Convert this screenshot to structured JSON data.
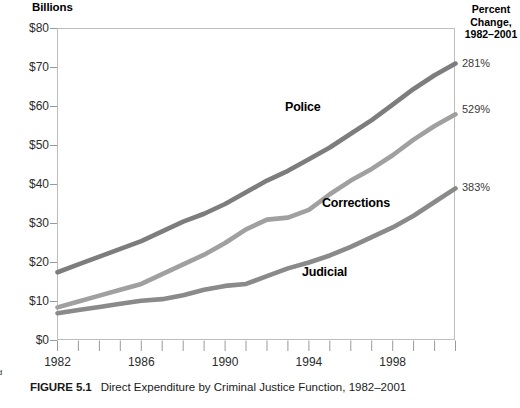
{
  "figure": {
    "number": "FIGURE 5.1",
    "caption": "Direct Expenditure by Criminal Justice Function, 1982–2001",
    "margin_scrap_top": "▪",
    "margin_scrap_bottom": "ed"
  },
  "chart_data": {
    "type": "line",
    "title": "Direct Expenditure by Criminal Justice Function, 1982–2001",
    "subtitle": "",
    "axis_header": "Billions",
    "xlabel": "",
    "ylabel": "Billions",
    "xlim": [
      1982,
      2001
    ],
    "ylim": [
      0,
      80
    ],
    "grid": false,
    "legend_position": "inline-annotations",
    "y_ticks": [
      0,
      10,
      20,
      30,
      40,
      50,
      60,
      70,
      80
    ],
    "y_tick_labels": [
      "$0",
      "$10",
      "$20",
      "$30",
      "$40",
      "$50",
      "$60",
      "$70",
      "$80"
    ],
    "x_ticks": [
      1982,
      1983,
      1984,
      1985,
      1986,
      1987,
      1988,
      1989,
      1990,
      1991,
      1992,
      1993,
      1994,
      1995,
      1996,
      1997,
      1998,
      1999,
      2000,
      2001
    ],
    "x_tick_labels_shown": [
      "1982",
      "1986",
      "1990",
      "1994",
      "1998"
    ],
    "x_labeled_ticks": [
      1982,
      1986,
      1990,
      1994,
      1998
    ],
    "x": [
      1982,
      1983,
      1984,
      1985,
      1986,
      1987,
      1988,
      1989,
      1990,
      1991,
      1992,
      1993,
      1994,
      1995,
      1996,
      1997,
      1998,
      1999,
      2000,
      2001
    ],
    "series": [
      {
        "name": "Police",
        "label": "Police",
        "color": "#7d7d7d",
        "percent_change": "281%",
        "values": [
          17.5,
          19.5,
          21.5,
          23.5,
          25.5,
          28.0,
          30.5,
          32.5,
          35.0,
          38.0,
          41.0,
          43.5,
          46.5,
          49.5,
          53.0,
          56.5,
          60.5,
          64.5,
          68.0,
          71.0
        ]
      },
      {
        "name": "Corrections",
        "label": "Corrections",
        "color": "#a0a0a0",
        "percent_change": "529%",
        "values": [
          8.5,
          10.0,
          11.5,
          13.0,
          14.5,
          17.0,
          19.5,
          22.0,
          25.0,
          28.5,
          31.0,
          31.5,
          33.5,
          37.5,
          41.0,
          44.0,
          47.5,
          51.5,
          55.0,
          58.0
        ]
      },
      {
        "name": "Judicial",
        "label": "Judicial",
        "color": "#8a8a8a",
        "percent_change": "383%",
        "values": [
          7.0,
          7.8,
          8.6,
          9.4,
          10.2,
          10.6,
          11.6,
          13.0,
          14.0,
          14.5,
          16.5,
          18.5,
          20.0,
          21.8,
          24.0,
          26.5,
          29.0,
          32.0,
          35.5,
          39.0
        ]
      }
    ],
    "annotations": {
      "percent_change_header_lines": [
        "Percent",
        "Change,",
        "1982–2001"
      ]
    }
  },
  "percent_panel": {
    "line1": "Percent",
    "line2": "Change,",
    "line3": "1982–2001",
    "police": "281%",
    "corrections": "529%",
    "judicial": "383%"
  },
  "labels": {
    "police": "Police",
    "corrections": "Corrections",
    "judicial": "Judicial",
    "billions": "Billions"
  }
}
